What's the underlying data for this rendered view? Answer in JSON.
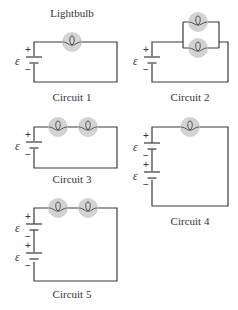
{
  "figure": {
    "bulb_label": "Lightbulb",
    "emf_symbol": "ε",
    "plus": "+",
    "minus": "−",
    "colors": {
      "wire": "#3a3a3a",
      "bulb": "#d3d3d3",
      "text": "#333333"
    },
    "circuits": [
      {
        "label": "Circuit 1",
        "batteries": 1,
        "bulbs": 1,
        "arrangement": "single"
      },
      {
        "label": "Circuit 2",
        "batteries": 1,
        "bulbs": 2,
        "arrangement": "parallel"
      },
      {
        "label": "Circuit 3",
        "batteries": 1,
        "bulbs": 2,
        "arrangement": "series"
      },
      {
        "label": "Circuit 4",
        "batteries": 2,
        "bulbs": 1,
        "arrangement": "series"
      },
      {
        "label": "Circuit 5",
        "batteries": 2,
        "bulbs": 2,
        "arrangement": "series"
      }
    ]
  }
}
